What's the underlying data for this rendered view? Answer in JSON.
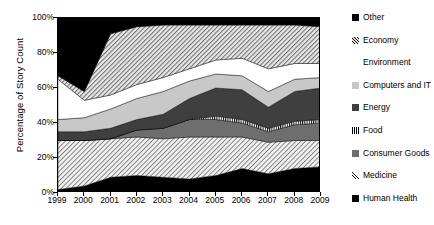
{
  "chart_data": {
    "type": "area",
    "title": "",
    "xlabel": "",
    "ylabel": "Percentage of Story Count",
    "stacked": true,
    "percent_stacked": true,
    "grid": false,
    "legend_position": "right",
    "ylim": [
      0,
      100
    ],
    "ytick_labels": [
      "0%",
      "20%",
      "40%",
      "60%",
      "80%",
      "100%"
    ],
    "ytick_values": [
      0,
      20,
      40,
      60,
      80,
      100
    ],
    "xlim": [
      1999,
      2009
    ],
    "x": [
      1999,
      2000,
      2001,
      2002,
      2003,
      2004,
      2005,
      2006,
      2007,
      2008,
      2009
    ],
    "xtick_labels": [
      "1999",
      "2000",
      "2001",
      "2002",
      "2003",
      "2004",
      "2005",
      "2006",
      "2007",
      "2008",
      "2009"
    ],
    "series": [
      {
        "name": "Human Health",
        "swatch": "black",
        "pattern": "solid",
        "color": "#000000",
        "values": [
          2,
          4,
          9,
          10,
          9,
          8,
          10,
          14,
          11,
          14,
          15
        ]
      },
      {
        "name": "Medicine",
        "swatch": "light-diagonal-hatch",
        "pattern": "diagonal-hatch-light",
        "color": "#ffffff",
        "values": [
          28,
          26,
          22,
          22,
          22,
          24,
          22,
          18,
          18,
          16,
          15
        ]
      },
      {
        "name": "Consumer Goods",
        "swatch": "medium-gray",
        "pattern": "solid",
        "color": "#6e6e6e",
        "values": [
          0,
          0,
          0,
          4,
          6,
          10,
          10,
          8,
          6,
          9,
          10
        ]
      },
      {
        "name": "Food",
        "swatch": "vertical-stripes",
        "pattern": "vertical-stripes",
        "color": "#ffffff",
        "values": [
          0,
          0,
          0,
          0,
          0,
          0,
          2,
          2,
          2,
          2,
          2
        ]
      },
      {
        "name": "Energy",
        "swatch": "dark-gray",
        "pattern": "solid",
        "color": "#3f3f3f",
        "values": [
          5,
          5,
          6,
          6,
          8,
          12,
          16,
          17,
          12,
          17,
          18
        ]
      },
      {
        "name": "Computers and IT",
        "swatch": "light-gray",
        "pattern": "solid",
        "color": "#c8c8c8",
        "values": [
          7,
          8,
          11,
          12,
          13,
          10,
          8,
          8,
          9,
          7,
          6
        ]
      },
      {
        "name": "Environment",
        "swatch": "white",
        "pattern": "solid",
        "color": "#ffffff",
        "values": [
          23,
          10,
          8,
          8,
          8,
          7,
          8,
          10,
          13,
          9,
          8
        ]
      },
      {
        "name": "Economy",
        "swatch": "diagonal-hatch",
        "pattern": "diagonal-hatch",
        "color": "#e2e2e2",
        "values": [
          2,
          5,
          35,
          33,
          30,
          25,
          20,
          19,
          25,
          22,
          21
        ]
      },
      {
        "name": "Other",
        "swatch": "black",
        "pattern": "solid",
        "color": "#000000",
        "values": [
          33,
          42,
          9,
          5,
          4,
          4,
          4,
          4,
          4,
          4,
          5
        ]
      }
    ]
  },
  "legend": {
    "items": [
      {
        "label": "Other",
        "swatch_class": "sw-black"
      },
      {
        "label": "Economy",
        "swatch_class": "sw-econ"
      },
      {
        "label": "Environment",
        "swatch_class": "sw-env"
      },
      {
        "label": "Computers and IT",
        "swatch_class": "sw-ltgray"
      },
      {
        "label": "Energy",
        "swatch_class": "sw-dkgray"
      },
      {
        "label": "Food",
        "swatch_class": "sw-food"
      },
      {
        "label": "Consumer Goods",
        "swatch_class": "sw-medgray"
      },
      {
        "label": "Medicine",
        "swatch_class": "sw-med"
      },
      {
        "label": "Human Health",
        "swatch_class": "sw-black"
      }
    ]
  }
}
